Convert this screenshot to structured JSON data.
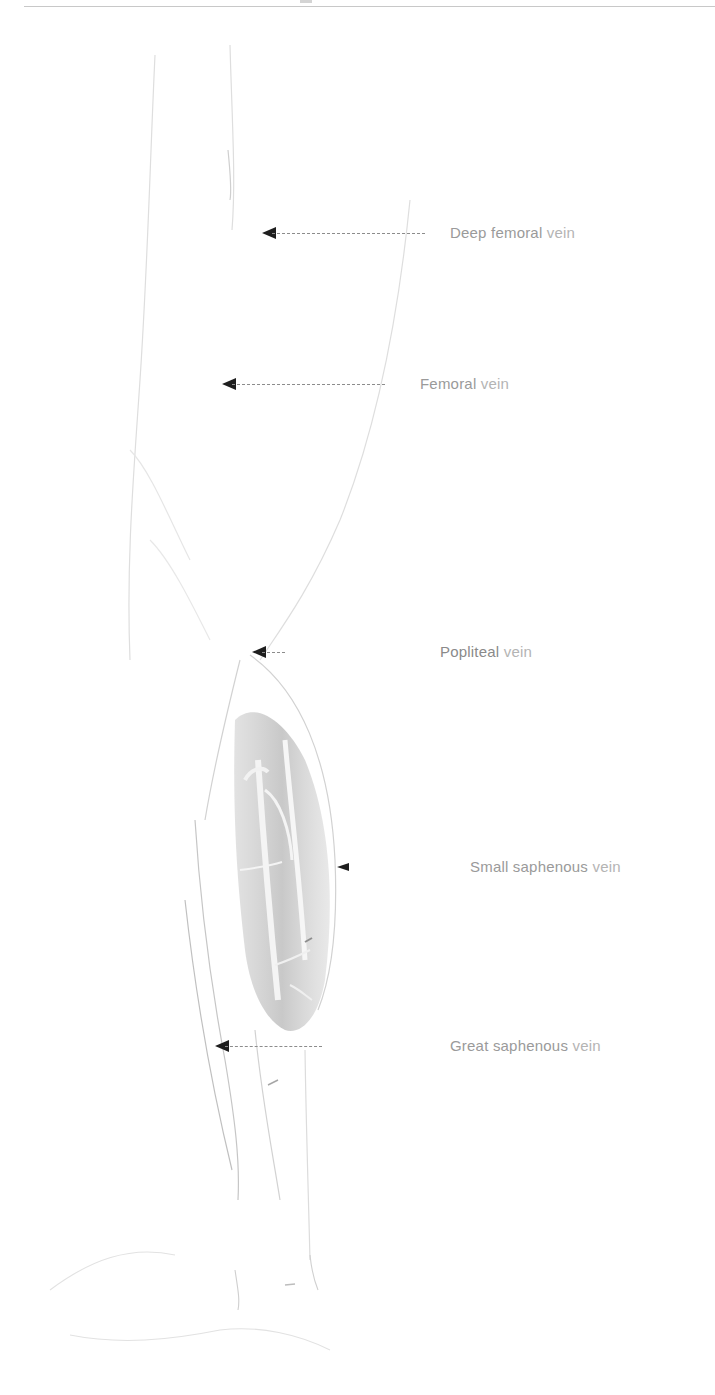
{
  "figure": {
    "background_color": "#ffffff",
    "label_color": "#b4b4b4",
    "arrow_color": "#1e1e1e",
    "labels": [
      {
        "id": "deep-femoral",
        "text_main": "Deep femoral",
        "text_suffix": " vein",
        "x": 450,
        "y": 224,
        "arrow_from": 425,
        "arrow_to": 262
      },
      {
        "id": "femoral",
        "text_main": "Femoral",
        "text_suffix": " vein",
        "x": 420,
        "y": 375,
        "arrow_from": 385,
        "arrow_to": 222
      },
      {
        "id": "popliteal",
        "text_main": "Popliteal",
        "text_suffix": " vein",
        "x": 440,
        "y": 643,
        "arrow_from": 285,
        "arrow_to": 252
      },
      {
        "id": "small-saphenous",
        "text_main": "Small saphenous",
        "text_suffix": " vein",
        "x": 470,
        "y": 858,
        "arrow_from": 352,
        "arrow_to": 337
      },
      {
        "id": "great-saphenous",
        "text_main": "Great saphenous",
        "text_suffix": " vein",
        "x": 450,
        "y": 1037,
        "arrow_from": 322,
        "arrow_to": 215
      }
    ]
  }
}
